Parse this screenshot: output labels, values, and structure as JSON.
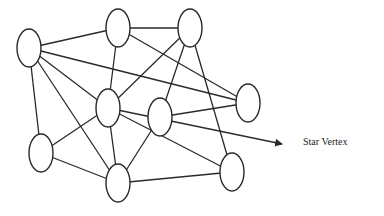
{
  "diagram": {
    "type": "graph",
    "annotation": {
      "label": "Star Vertex",
      "target_node": "D"
    },
    "colors": {
      "stroke": "#2a2a2a",
      "background": "#ffffff"
    },
    "nodes": [
      {
        "id": "A",
        "cx": 29,
        "cy": 48,
        "rx": 12,
        "ry": 19
      },
      {
        "id": "B",
        "cx": 118,
        "cy": 28,
        "rx": 12,
        "ry": 19
      },
      {
        "id": "C",
        "cx": 190,
        "cy": 28,
        "rx": 12,
        "ry": 19
      },
      {
        "id": "D",
        "cx": 108,
        "cy": 108,
        "rx": 12,
        "ry": 19
      },
      {
        "id": "E",
        "cx": 160,
        "cy": 117,
        "rx": 12,
        "ry": 19
      },
      {
        "id": "F",
        "cx": 248,
        "cy": 103,
        "rx": 12,
        "ry": 19
      },
      {
        "id": "G",
        "cx": 41,
        "cy": 153,
        "rx": 12,
        "ry": 19
      },
      {
        "id": "H",
        "cx": 118,
        "cy": 183,
        "rx": 12,
        "ry": 19
      },
      {
        "id": "I",
        "cx": 232,
        "cy": 172,
        "rx": 12,
        "ry": 19
      }
    ],
    "edges": [
      [
        "A",
        "B"
      ],
      [
        "A",
        "F"
      ],
      [
        "A",
        "D"
      ],
      [
        "A",
        "H"
      ],
      [
        "A",
        "G"
      ],
      [
        "B",
        "C"
      ],
      [
        "B",
        "D"
      ],
      [
        "B",
        "F"
      ],
      [
        "C",
        "D"
      ],
      [
        "C",
        "E"
      ],
      [
        "C",
        "I"
      ],
      [
        "D",
        "G"
      ],
      [
        "D",
        "H"
      ],
      [
        "D",
        "I"
      ],
      [
        "E",
        "F"
      ],
      [
        "E",
        "H"
      ],
      [
        "G",
        "H"
      ],
      [
        "H",
        "I"
      ]
    ],
    "arrow": {
      "from": "D",
      "x1": 108,
      "y1": 108,
      "x2": 282,
      "y2": 144
    }
  }
}
